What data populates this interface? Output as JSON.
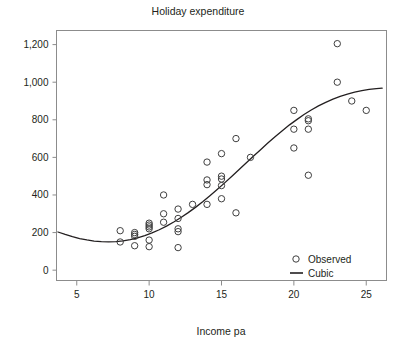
{
  "chart_data": {
    "type": "scatter",
    "title": "Holiday expenditure",
    "xlabel": "Income pa",
    "ylabel": "",
    "xlim": [
      3.6,
      26.4
    ],
    "ylim": [
      -55,
      1275
    ],
    "grid": false,
    "xticks": [
      5,
      10,
      15,
      20,
      25
    ],
    "xtick_labels": [
      "5",
      "10",
      "15",
      "20",
      "25"
    ],
    "yticks": [
      0,
      200,
      400,
      600,
      800,
      1000,
      1200
    ],
    "ytick_labels": [
      "0",
      "200",
      "400",
      "600",
      "800",
      "1,000",
      "1,200"
    ],
    "legend_position": "bottom-right",
    "series": [
      {
        "name": "Observed",
        "type": "scatter",
        "marker": "open-circle",
        "color": "#3f3f3f",
        "points": [
          [
            8,
            210
          ],
          [
            8,
            150
          ],
          [
            9,
            200
          ],
          [
            9,
            190
          ],
          [
            9,
            180
          ],
          [
            9,
            130
          ],
          [
            10,
            250
          ],
          [
            10,
            240
          ],
          [
            10,
            230
          ],
          [
            10,
            220
          ],
          [
            10,
            160
          ],
          [
            10,
            125
          ],
          [
            11,
            400
          ],
          [
            11,
            300
          ],
          [
            11,
            255
          ],
          [
            12,
            325
          ],
          [
            12,
            275
          ],
          [
            12,
            220
          ],
          [
            12,
            205
          ],
          [
            12,
            120
          ],
          [
            13,
            350
          ],
          [
            14,
            575
          ],
          [
            14,
            480
          ],
          [
            14,
            455
          ],
          [
            14,
            350
          ],
          [
            15,
            620
          ],
          [
            15,
            500
          ],
          [
            15,
            485
          ],
          [
            15,
            450
          ],
          [
            15,
            380
          ],
          [
            16,
            700
          ],
          [
            16,
            305
          ],
          [
            17,
            600
          ],
          [
            20,
            850
          ],
          [
            20,
            750
          ],
          [
            20,
            650
          ],
          [
            21,
            805
          ],
          [
            21,
            795
          ],
          [
            21,
            750
          ],
          [
            21,
            505
          ],
          [
            23,
            1205
          ],
          [
            23,
            1000
          ],
          [
            24,
            900
          ],
          [
            25,
            850
          ]
        ]
      },
      {
        "name": "Cubic",
        "type": "line",
        "color": "#231f20",
        "curve": [
          [
            3.7,
            203
          ],
          [
            4.2,
            190
          ],
          [
            4.7,
            178
          ],
          [
            5.2,
            168
          ],
          [
            5.7,
            161
          ],
          [
            6.2,
            155
          ],
          [
            6.7,
            152
          ],
          [
            7.2,
            151
          ],
          [
            7.7,
            152
          ],
          [
            8.2,
            156
          ],
          [
            8.7,
            163
          ],
          [
            9.2,
            172
          ],
          [
            9.7,
            184
          ],
          [
            10.2,
            198
          ],
          [
            10.7,
            215
          ],
          [
            11.2,
            234
          ],
          [
            11.7,
            256
          ],
          [
            12.2,
            280
          ],
          [
            12.7,
            306
          ],
          [
            13.2,
            334
          ],
          [
            13.7,
            364
          ],
          [
            14.2,
            396
          ],
          [
            14.7,
            429
          ],
          [
            15.2,
            463
          ],
          [
            15.7,
            498
          ],
          [
            16.2,
            534
          ],
          [
            16.7,
            570
          ],
          [
            17.2,
            606
          ],
          [
            17.7,
            641
          ],
          [
            18.2,
            676
          ],
          [
            18.7,
            710
          ],
          [
            19.2,
            742
          ],
          [
            19.7,
            773
          ],
          [
            20.2,
            801
          ],
          [
            20.7,
            828
          ],
          [
            21.2,
            852
          ],
          [
            21.7,
            874
          ],
          [
            22.2,
            893
          ],
          [
            22.7,
            910
          ],
          [
            23.2,
            925
          ],
          [
            23.7,
            937
          ],
          [
            24.2,
            947
          ],
          [
            24.7,
            955
          ],
          [
            25.2,
            962
          ],
          [
            25.7,
            966
          ],
          [
            26.1,
            968
          ]
        ]
      }
    ],
    "legend_entries": [
      {
        "label": "Observed",
        "marker": "open-circle"
      },
      {
        "label": "Cubic",
        "marker": "line"
      }
    ]
  }
}
